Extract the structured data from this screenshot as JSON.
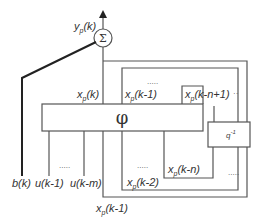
{
  "diagram": {
    "type": "block-diagram",
    "summation": {
      "symbol": "Σ",
      "output_label": "y_p(k)"
    },
    "function_block": {
      "symbol": "φ"
    },
    "delay_block": {
      "symbol": "q",
      "exponent": "-1"
    },
    "labels": {
      "yp": {
        "base": "y",
        "sub": "p",
        "arg": "(k)"
      },
      "xp_k": {
        "base": "x",
        "sub": "p",
        "arg": "(k)"
      },
      "xp_k1_top": {
        "base": "x",
        "sub": "p",
        "arg": "(k-1)"
      },
      "xp_kn1": {
        "base": "x",
        "sub": "p",
        "arg": "(k-n+1)"
      },
      "xp_kn": {
        "base": "x",
        "sub": "p",
        "arg": "(k-n)"
      },
      "xp_k2": {
        "base": "x",
        "sub": "p",
        "arg": "(k-2)"
      },
      "xp_k1_bottom": {
        "base": "x",
        "sub": "p",
        "arg": "(k-1)"
      },
      "b_k": "b(k)",
      "u_k1": "u(k-1)",
      "u_km": "u(k-m)"
    },
    "ellipsis": "....."
  }
}
